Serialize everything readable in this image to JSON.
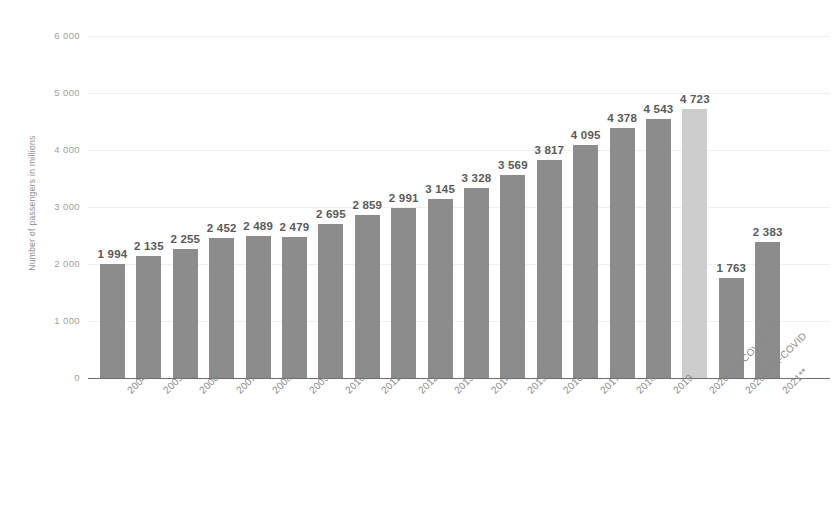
{
  "chart_data": {
    "type": "bar",
    "title": "",
    "subtitle": "",
    "xlabel": "",
    "ylabel": "Number of passengers in millions",
    "ylim": [
      0,
      6000
    ],
    "ytick_labels": [
      "6 000",
      "5 000",
      "4 000",
      "3 000",
      "2 000",
      "1 000",
      "0"
    ],
    "ytick_values": [
      6000,
      5000,
      4000,
      3000,
      2000,
      1000,
      0
    ],
    "grid": true,
    "legend": "none",
    "categories": [
      "2004",
      "2005",
      "2006",
      "2007",
      "2008",
      "2009",
      "2010",
      "2011",
      "2012",
      "2013",
      "2014",
      "2015",
      "2016",
      "2017",
      "2018",
      "2019",
      "2020 pre-COVID*, **",
      "2020 post-COVID",
      "2021**"
    ],
    "values": [
      1994,
      2135,
      2255,
      2452,
      2489,
      2479,
      2695,
      2859,
      2991,
      3145,
      3328,
      3569,
      3817,
      4095,
      4378,
      4543,
      4723,
      1763,
      2383
    ],
    "value_labels": [
      "1 994",
      "2 135",
      "2 255",
      "2 452",
      "2 489",
      "2 479",
      "2 695",
      "2 859",
      "2 991",
      "3 145",
      "3 328",
      "3 569",
      "3 817",
      "4 095",
      "4 378",
      "4 543",
      "4 723",
      "1 763",
      "2 383"
    ],
    "highlight_index": 16,
    "colors": {
      "bar": "#8c8c8c",
      "bar_highlight": "#cdcdcd",
      "grid": "#f0f0f0",
      "axis": "#6d6d6d",
      "tick_text": "#a0a0a0",
      "label_text": "#5a5a5a",
      "background": "#ffffff"
    }
  }
}
